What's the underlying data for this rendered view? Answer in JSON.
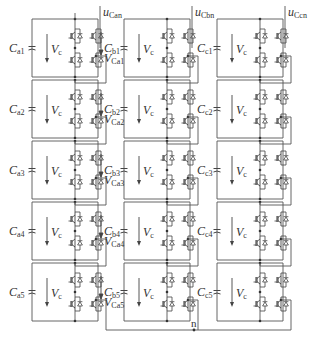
{
  "diagram": {
    "phases": [
      {
        "id": "a",
        "output_label": {
          "main": "u",
          "sub": "Can"
        },
        "modules": [
          {
            "cap": {
              "main": "C",
              "sub": "a1"
            },
            "vc": {
              "main": "V",
              "sub": "c"
            },
            "v_out": {
              "main": "V",
              "sub": "Ca1"
            }
          },
          {
            "cap": {
              "main": "C",
              "sub": "a2"
            },
            "vc": {
              "main": "V",
              "sub": "c"
            },
            "v_out": {
              "main": "V",
              "sub": "Ca2"
            }
          },
          {
            "cap": {
              "main": "C",
              "sub": "a3"
            },
            "vc": {
              "main": "V",
              "sub": "c"
            },
            "v_out": {
              "main": "V",
              "sub": "Ca3"
            }
          },
          {
            "cap": {
              "main": "C",
              "sub": "a4"
            },
            "vc": {
              "main": "V",
              "sub": "c"
            },
            "v_out": {
              "main": "V",
              "sub": "Ca4"
            }
          },
          {
            "cap": {
              "main": "C",
              "sub": "a5"
            },
            "vc": {
              "main": "V",
              "sub": "c"
            },
            "v_out": {
              "main": "V",
              "sub": "Ca5"
            }
          }
        ]
      },
      {
        "id": "b",
        "output_label": {
          "main": "u",
          "sub": "Cbn"
        },
        "modules": [
          {
            "cap": {
              "main": "C",
              "sub": "b1"
            },
            "vc": {
              "main": "V",
              "sub": "c"
            }
          },
          {
            "cap": {
              "main": "C",
              "sub": "b2"
            },
            "vc": {
              "main": "V",
              "sub": "c"
            }
          },
          {
            "cap": {
              "main": "C",
              "sub": "b3"
            },
            "vc": {
              "main": "V",
              "sub": "c"
            }
          },
          {
            "cap": {
              "main": "C",
              "sub": "b4"
            },
            "vc": {
              "main": "V",
              "sub": "c"
            }
          },
          {
            "cap": {
              "main": "C",
              "sub": "b5"
            },
            "vc": {
              "main": "V",
              "sub": "c"
            }
          }
        ]
      },
      {
        "id": "c",
        "output_label": {
          "main": "u",
          "sub": "Ccn"
        },
        "modules": [
          {
            "cap": {
              "main": "C",
              "sub": "c1"
            },
            "vc": {
              "main": "V",
              "sub": "c"
            }
          },
          {
            "cap": {
              "main": "C",
              "sub": "c2"
            },
            "vc": {
              "main": "V",
              "sub": "c"
            }
          },
          {
            "cap": {
              "main": "C",
              "sub": "c3"
            },
            "vc": {
              "main": "V",
              "sub": "c"
            }
          },
          {
            "cap": {
              "main": "C",
              "sub": "c4"
            },
            "vc": {
              "main": "V",
              "sub": "c"
            }
          },
          {
            "cap": {
              "main": "C",
              "sub": "c5"
            },
            "vc": {
              "main": "V",
              "sub": "c"
            }
          }
        ]
      }
    ],
    "neutral_label": "n",
    "colors": {
      "line": "#555555",
      "text": "#333333",
      "background": "#ffffff"
    }
  }
}
